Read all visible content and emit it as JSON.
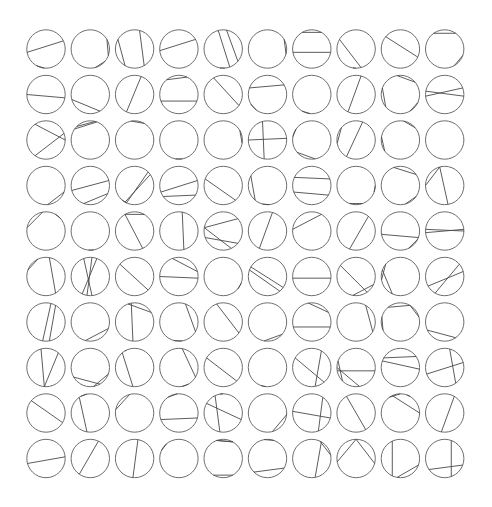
{
  "diagram": {
    "title": "",
    "rows": 10,
    "cols": 10,
    "origin": {
      "x": 46,
      "y": 49
    },
    "spacing": {
      "x": 44.3,
      "y": 45.5
    },
    "radius": 19.2,
    "colors": {
      "circle": "#6e6e6e",
      "chord": "#4a4a4a",
      "background": "#ffffff"
    },
    "cells": [
      [
        [
          [
            170,
            335
          ],
          [
            95,
            120
          ]
        ],
        [
          [
            330,
            20
          ],
          [
            40,
            75
          ]
        ],
        [
          [
            210,
            120
          ],
          [
            285,
            60
          ]
        ],
        [
          [
            175,
            330
          ]
        ],
        [
          [
            255,
            70
          ],
          [
            280,
            40
          ],
          [
            85,
            100
          ]
        ],
        [
          [
            330,
            15
          ]
        ],
        [
          [
            240,
            300
          ],
          [
            170,
            10
          ]
        ],
        [
          [
            210,
            75
          ],
          [
            100,
            90
          ]
        ],
        [
          [
            220,
            25
          ]
        ],
        [
          [
            235,
            305
          ],
          [
            20,
            60
          ]
        ]
      ],
      [
        [
          [
            180,
            10
          ]
        ],
        [
          [
            165,
            60
          ]
        ],
        [
          [
            115,
            290
          ]
        ],
        [
          [
            230,
            295
          ],
          [
            160,
            20
          ]
        ],
        [
          [
            240,
            35
          ]
        ],
        [
          [
            200,
            330
          ],
          [
            150,
            125
          ]
        ],
        [
          [
            95,
            120
          ]
        ],
        [
          [
            115,
            285
          ]
        ],
        [
          [
            260,
            320
          ],
          [
            140,
            200
          ],
          [
            25,
            60
          ]
        ],
        [
          [
            175,
            340
          ],
          [
            190,
            5
          ]
        ]
      ],
      [
        [
          [
            235,
            0
          ],
          [
            125,
            340
          ]
        ],
        [
          [
            215,
            290
          ],
          [
            225,
            285
          ]
        ],
        [
          [
            260,
            300
          ]
        ],
        [
          [
            100,
            80
          ]
        ],
        [
          [
            330,
            10
          ]
        ],
        [
          [
            180,
            355
          ],
          [
            255,
            100
          ]
        ],
        [
          [
            140,
            80
          ],
          [
            215,
            190
          ]
        ],
        [
          [
            290,
            120
          ],
          [
            220,
            170
          ]
        ],
        [
          [
            280,
            320
          ],
          [
            145,
            190
          ]
        ],
        null
      ],
      [
        [
          [
            85,
            20
          ]
        ],
        [
          [
            165,
            345
          ],
          [
            110,
            25
          ]
        ],
        [
          [
            120,
            325
          ],
          [
            115,
            315
          ],
          [
            115,
            130
          ]
        ],
        [
          [
            160,
            345
          ],
          [
            145,
            30
          ]
        ],
        [
          [
            200,
            50
          ]
        ],
        [
          [
            130,
            210
          ],
          [
            105,
            85
          ]
        ],
        [
          [
            205,
            340
          ],
          [
            160,
            30
          ]
        ],
        [
          [
            110,
            70
          ],
          [
            0,
            20
          ]
        ],
        [
          [
            250,
            325
          ],
          [
            75,
            35
          ]
        ],
        [
          [
            180,
            255
          ],
          [
            255,
            80
          ]
        ]
      ],
      [
        [
          [
            190,
            260
          ],
          [
            300,
            320
          ]
        ],
        [
          [
            95,
            80
          ]
        ],
        [
          [
            240,
            300
          ],
          [
            240,
            65
          ]
        ],
        [
          [
            280,
            75
          ]
        ],
        [
          [
            190,
            320
          ],
          [
            190,
            65
          ],
          [
            40,
            160
          ]
        ],
        [
          [
            285,
            115
          ]
        ],
        [
          [
            300,
            185
          ]
        ],
        [
          [
            310,
            110
          ]
        ],
        [
          [
            170,
            20
          ],
          [
            65,
            25
          ]
        ],
        [
          [
            175,
            355
          ],
          [
            185,
            0
          ]
        ]
      ],
      [
        [
          [
            200,
            245
          ],
          [
            280,
            60
          ]
        ],
        [
          [
            275,
            100
          ],
          [
            290,
            115
          ],
          [
            250,
            85
          ]
        ],
        [
          [
            220,
            45
          ]
        ],
        [
          [
            250,
            345
          ],
          [
            180,
            5
          ]
        ],
        [
          [
            20,
            40
          ]
        ],
        [
          [
            210,
            35
          ],
          [
            200,
            50
          ]
        ],
        [
          [
            175,
            5
          ]
        ],
        [
          [
            215,
            55
          ],
          [
            100,
            25
          ]
        ],
        [
          [
            170,
            220
          ],
          [
            115,
            200
          ]
        ],
        [
          [
            120,
            320
          ],
          [
            150,
            345
          ]
        ]
      ],
      [
        [
          [
            285,
            100
          ],
          [
            300,
            80
          ]
        ],
        [
          [
            105,
            20
          ]
        ],
        [
          [
            250,
            330
          ],
          [
            260,
            95
          ]
        ],
        [
          [
            290,
            30
          ],
          [
            105,
            80
          ]
        ],
        [
          [
            250,
            35
          ]
        ],
        [
          [
            100,
            40
          ]
        ],
        [
          [
            165,
            15
          ],
          [
            260,
            330
          ]
        ],
        [
          [
            300,
            30
          ]
        ],
        [
          [
            230,
            300
          ],
          [
            300,
            345
          ],
          [
            155,
            195
          ]
        ],
        [
          [
            155,
            55
          ]
        ]
      ],
      [
        [
          [
            255,
            95
          ],
          [
            310,
            95
          ]
        ],
        [
          [
            150,
            60
          ],
          [
            80,
            20
          ]
        ],
        [
          [
            230,
            95
          ],
          [
            240,
            245
          ]
        ],
        [
          [
            280,
            30
          ],
          [
            60,
            80
          ]
        ],
        [
          [
            210,
            45
          ]
        ],
        [
          [
            95,
            110
          ]
        ],
        [
          [
            210,
            50
          ],
          [
            300,
            80
          ]
        ],
        [
          [
            180,
            80
          ],
          [
            170,
            10
          ],
          [
            135,
            200
          ]
        ],
        [
          [
            210,
            325
          ],
          [
            200,
            5
          ]
        ],
        [
          [
            285,
            55
          ],
          [
            160,
            345
          ]
        ]
      ],
      [
        [
          [
            220,
            30
          ]
        ],
        [
          [
            235,
            100
          ],
          [
            240,
            260
          ]
        ],
        [
          [
            190,
            255
          ]
        ],
        [
          [
            235,
            265
          ],
          [
            160,
            15
          ]
        ],
        [
          [
            210,
            20
          ],
          [
            245,
            100
          ],
          [
            260,
            270
          ]
        ],
        [
          [
            75,
            5
          ]
        ],
        [
          [
            185,
            15
          ],
          [
            305,
            70
          ]
        ],
        [
          [
            240,
            60
          ]
        ],
        [
          [
            245,
            0
          ],
          [
            235,
            270
          ],
          [
            300,
            290
          ]
        ],
        [
          [
            300,
            100
          ]
        ]
      ],
      [
        [
          [
            165,
            355
          ]
        ],
        [
          [
            295,
            125
          ]
        ],
        [
          [
            280,
            95
          ]
        ],
        [
          [
            205,
            230
          ]
        ],
        [
          [
            60,
            120
          ],
          [
            300,
            250
          ],
          [
            250,
            300
          ]
        ],
        [
          [
            30,
            135
          ],
          [
            260,
            290
          ]
        ],
        [
          [
            300,
            80
          ],
          [
            295,
            350
          ]
        ],
        [
          [
            170,
            270
          ],
          [
            270,
            15
          ]
        ],
        [
          [
            245,
            115
          ],
          [
            20,
            100
          ]
        ],
        [
          [
            290,
            70
          ],
          [
            145,
            20
          ]
        ]
      ]
    ]
  }
}
